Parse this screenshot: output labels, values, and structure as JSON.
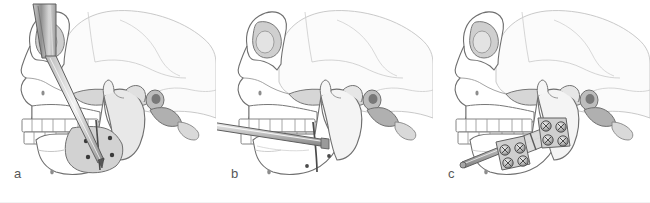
{
  "figure": {
    "panel_count": 3,
    "view": "lateral skull view",
    "background_color": "#ffffff",
    "width": 650,
    "height": 203
  },
  "palette": {
    "outline": "#6d6d6d",
    "outline_light": "#b9b9b9",
    "cranium_fill": "#fbfbfb",
    "bone_fill": "#ffffff",
    "shade_light": "#ededed",
    "shade_mid": "#d4d4d4",
    "shade_dark": "#a8a8a8",
    "shade_darker": "#8a8a8a",
    "metal_light": "#e2e2e2",
    "metal_mid": "#b5b5b5",
    "metal_dark": "#7d7d7d",
    "screw_dot": "#3a3a3a",
    "label_color": "#575757"
  },
  "panels": [
    {
      "id": "panel-a",
      "label": "a",
      "caption": "Drill/trocar inserted through ramus with osteotomy line and four screw holes marked on mandible",
      "instrument": {
        "name": "drill-handle",
        "type": "cylindrical handle with long needle shaft",
        "orientation": "oblique superior-to-inferior"
      },
      "markers": {
        "screw_hole_count": 4,
        "osteotomy_line": true
      }
    },
    {
      "id": "panel-b",
      "label": "b",
      "caption": "Horizontal alignment rod placed across occlusal plane with osteotomy completed through mandibular body",
      "instrument": {
        "name": "alignment-rod",
        "type": "long straight bar",
        "orientation": "near-horizontal, slight downward slope to the right"
      },
      "markers": {
        "screw_hole_count": 3,
        "osteotomy_line": true
      }
    },
    {
      "id": "panel-c",
      "label": "c",
      "caption": "Distraction device fixed with two four-screw footplate clusters bridging the osteotomy, connected by activation rod",
      "instrument": {
        "name": "distraction-device",
        "type": "bone plate with distraction rod",
        "orientation": "along mandibular body"
      },
      "markers": {
        "footplate_clusters": 2,
        "screws_per_cluster": 4,
        "screw_hole_count": 8,
        "osteotomy_line": true
      }
    }
  ]
}
